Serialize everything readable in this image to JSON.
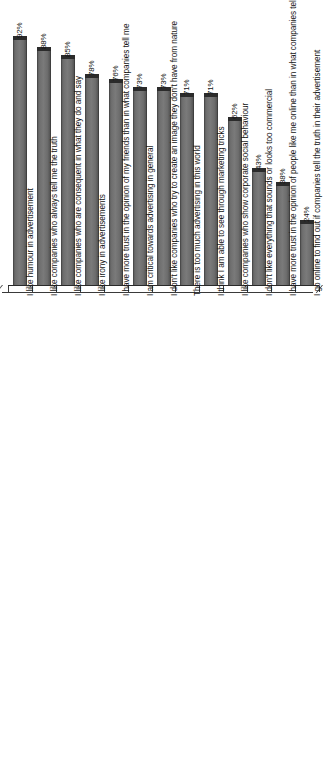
{
  "chart_data": {
    "type": "bar",
    "title": "",
    "subtitle": "",
    "xlabel": "",
    "ylabel": "",
    "ylim": [
      0,
      100
    ],
    "grid": false,
    "legend": false,
    "orientation": "vertical",
    "value_suffix": "%",
    "label_rotation_deg": -90,
    "categories": [
      "I like humour in advertisement",
      "I like companies who always tell me the truth",
      "I like companies who are consequent in what they do and say",
      "I like irony in advertisements",
      "I have more trust in the opinion of my friends than in what companies tell me",
      "I am critical towards advertising in general",
      "I don't like companies who try to create an image they don't have from nature",
      "There is too much advertising in this world",
      "I think I am able to see through marketing tricks",
      "I like companies who show corporate social behaviour",
      "I don't like everything that sounds or looks too commercial",
      "I have more trust in the opinion of people like me online than in what companies tell me",
      "I go online to find out if companies tell the truth in their advertisement"
    ],
    "values": [
      92,
      88,
      85,
      78,
      76,
      73,
      73,
      71,
      71,
      62,
      43,
      38,
      24
    ],
    "value_labels": [
      "92%",
      "88%",
      "85%",
      "78%",
      "76%",
      "73%",
      "73%",
      "71%",
      "71%",
      "62%",
      "43%",
      "38%",
      "24%"
    ],
    "colors": {
      "bar": "#6f6f6f",
      "bar_cap": "#2b2b2b",
      "axis": "#2a2a2a",
      "text": "#141414",
      "background": "#ffffff"
    }
  }
}
